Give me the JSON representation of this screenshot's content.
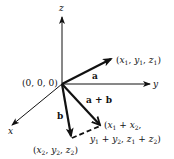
{
  "diagram": {
    "colors": {
      "ink": "#111111",
      "background": "#ffffff"
    },
    "axes": {
      "x": {
        "label": "x"
      },
      "y": {
        "label": "y"
      },
      "z": {
        "label": "z"
      }
    },
    "origin": {
      "label": "(0, 0, 0)"
    },
    "vectors": {
      "a": {
        "label": "a",
        "tip_label": "(x1, y1, z1)"
      },
      "b": {
        "label": "b",
        "tip_label": "(x2, y2, z2)"
      },
      "sum": {
        "label": "a + b",
        "tip_label_line1": "(x1 + x2,",
        "tip_label_line2": "y1 + y2, z1 + z2)"
      }
    },
    "text": {
      "origin": "(0, 0, 0)",
      "x_axis": "x",
      "y_axis": "y",
      "z_axis": "z",
      "vec_a": "a",
      "vec_b": "b",
      "vec_sum": "a + b",
      "tip_a_open": "(",
      "tip_a_x": "x",
      "tip_a_sub1": "1",
      "tip_a_y": "y",
      "tip_a_z": "z",
      "tip_b_x": "x",
      "tip_b_y": "y",
      "tip_b_z": "z",
      "sub1": "1",
      "sub2": "2"
    }
  }
}
